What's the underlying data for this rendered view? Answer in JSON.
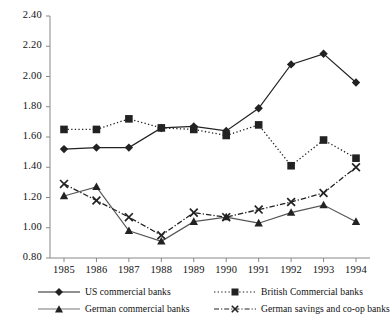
{
  "chart_data": {
    "type": "line",
    "title": "",
    "xlabel": "",
    "ylabel": "",
    "x": [
      1985,
      1986,
      1987,
      1988,
      1989,
      1990,
      1991,
      1992,
      1993,
      1994
    ],
    "categories": [
      "1985",
      "1986",
      "1987",
      "1988",
      "1989",
      "1990",
      "1991",
      "1992",
      "1993",
      "1994"
    ],
    "ylim": [
      0.8,
      2.4
    ],
    "ytick_step": 0.2,
    "yticks": [
      "2.40",
      "2.20",
      "2.00",
      "1.80",
      "1.60",
      "1.40",
      "1.20",
      "1.00",
      "0.80"
    ],
    "ytick_values": [
      2.4,
      2.2,
      2.0,
      1.8,
      1.6,
      1.4,
      1.2,
      1.0,
      0.8
    ],
    "grid": false,
    "legend_position": "bottom",
    "series": [
      {
        "name": "US commercial banks",
        "marker": "diamond",
        "line_style": "solid",
        "color": "#222222",
        "values": [
          1.52,
          1.53,
          1.53,
          1.66,
          1.67,
          1.64,
          1.79,
          2.08,
          2.15,
          1.96
        ]
      },
      {
        "name": "British Commercial banks",
        "marker": "square",
        "line_style": "dotted",
        "color": "#222222",
        "values": [
          1.65,
          1.65,
          1.72,
          1.66,
          1.65,
          1.61,
          1.68,
          1.41,
          1.58,
          1.46
        ]
      },
      {
        "name": "German commercial banks",
        "marker": "triangle",
        "line_style": "solid",
        "color": "#555555",
        "values": [
          1.21,
          1.27,
          0.98,
          0.91,
          1.04,
          1.07,
          1.03,
          1.1,
          1.15,
          1.04
        ]
      },
      {
        "name": "German savings and co-op banks",
        "marker": "cross",
        "line_style": "dashdot",
        "color": "#222222",
        "values": [
          1.29,
          1.18,
          1.07,
          0.95,
          1.1,
          1.07,
          1.12,
          1.17,
          1.23,
          1.4
        ]
      }
    ]
  },
  "legend": {
    "items": [
      {
        "label": "US commercial banks"
      },
      {
        "label": "British Commercial banks"
      },
      {
        "label": "German commercial banks"
      },
      {
        "label": "German savings and co-op banks"
      }
    ]
  }
}
